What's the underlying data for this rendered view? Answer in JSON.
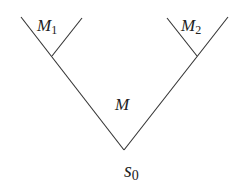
{
  "diagram": {
    "type": "tree",
    "nodes": [
      {
        "id": "root",
        "label": "s",
        "sub": "0",
        "position": "bottom vertex"
      },
      {
        "id": "M",
        "label": "M",
        "sub": "",
        "position": "main cone interior"
      },
      {
        "id": "M1",
        "label": "M",
        "sub": "1",
        "position": "upper-left sub-cone"
      },
      {
        "id": "M2",
        "label": "M",
        "sub": "2",
        "position": "upper-right sub-cone"
      }
    ],
    "line_color": "#333333"
  },
  "labels": {
    "M_main": "M",
    "M1": "M",
    "M1_sub": "1",
    "M2": "M",
    "M2_sub": "2",
    "s0": "s",
    "s0_sub": "0"
  }
}
